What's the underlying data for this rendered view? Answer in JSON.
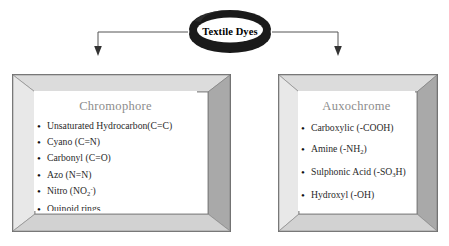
{
  "diagram": {
    "title": "Textile Dyes",
    "title_shape": "ellipse-ring",
    "colors": {
      "frame_light": "#d4d4d4",
      "frame_mid": "#b8b8b8",
      "frame_dark": "#9a9a9a",
      "ring": "#1a1a1a",
      "heading_text": "#8c8c8c",
      "body_text": "#2a2a2a",
      "connector": "#555555",
      "background": "#ffffff"
    },
    "connectors": [
      {
        "name": "arrow-to-chromophore",
        "direction": "down",
        "target": "Chromophore"
      },
      {
        "name": "arrow-to-auxochrome",
        "direction": "down",
        "target": "Auxochrome"
      }
    ],
    "panels": [
      {
        "id": "chromophore",
        "heading": "Chromophore",
        "items": [
          {
            "label": "Unsaturated Hydrocarbon(C=C)",
            "html": "Unsaturated Hydrocarbon(C=C)"
          },
          {
            "label": "Cyano (C=N)",
            "html": "Cyano (C=N)"
          },
          {
            "label": "Carbonyl (C=O)",
            "html": "Carbonyl (C=O)"
          },
          {
            "label": "Azo (N=N)",
            "html": "Azo (N=N)"
          },
          {
            "label": "Nitro (NO2-)",
            "html": "Nitro (NO<sub>2</sub><sup>-</sup>)"
          },
          {
            "label": "Quinoid rings",
            "html": "Quinoid rings"
          }
        ]
      },
      {
        "id": "auxochrome",
        "heading": "Auxochrome",
        "items": [
          {
            "label": "Carboxylic (-COOH)",
            "html": "Carboxylic (-COOH)"
          },
          {
            "label": "Amine (-NH2)",
            "html": "Amine (-NH<sub>2</sub>)"
          },
          {
            "label": "Sulphonic Acid (-SO3H)",
            "html": "Sulphonic Acid (-SO<sub>3</sub>H)"
          },
          {
            "label": "Hydroxyl (-OH)",
            "html": "Hydroxyl (-OH)"
          }
        ]
      }
    ]
  }
}
